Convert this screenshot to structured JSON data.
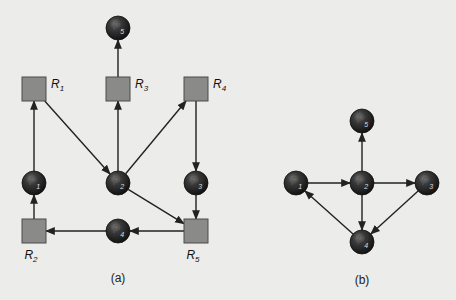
{
  "figure": {
    "panels": [
      {
        "id": "a",
        "caption": "(a)",
        "type": "resource-allocation-graph",
        "processes": [
          {
            "id": "P1",
            "name": "P",
            "sub": "1",
            "x": 34,
            "y": 183
          },
          {
            "id": "P2",
            "name": "P",
            "sub": "2",
            "x": 118,
            "y": 183
          },
          {
            "id": "P3",
            "name": "P",
            "sub": "3",
            "x": 196,
            "y": 183
          },
          {
            "id": "P4",
            "name": "P",
            "sub": "4",
            "x": 118,
            "y": 231
          },
          {
            "id": "P5",
            "name": "P",
            "sub": "5",
            "x": 118,
            "y": 28
          }
        ],
        "resources": [
          {
            "id": "R1",
            "name": "R",
            "sub": "1",
            "x": 34,
            "y": 89,
            "label_pos": "right"
          },
          {
            "id": "R2",
            "name": "R",
            "sub": "2",
            "x": 34,
            "y": 231,
            "label_pos": "below"
          },
          {
            "id": "R3",
            "name": "R",
            "sub": "3",
            "x": 118,
            "y": 89,
            "label_pos": "right"
          },
          {
            "id": "R4",
            "name": "R",
            "sub": "4",
            "x": 196,
            "y": 89,
            "label_pos": "right"
          },
          {
            "id": "R5",
            "name": "R",
            "sub": "5",
            "x": 196,
            "y": 231,
            "label_pos": "below"
          }
        ],
        "edges": [
          {
            "from": "P1",
            "to": "R1"
          },
          {
            "from": "R1",
            "to": "P2"
          },
          {
            "from": "P2",
            "to": "R3"
          },
          {
            "from": "R3",
            "to": "P5"
          },
          {
            "from": "P2",
            "to": "R4"
          },
          {
            "from": "R4",
            "to": "P3"
          },
          {
            "from": "P2",
            "to": "R5"
          },
          {
            "from": "P3",
            "to": "R5"
          },
          {
            "from": "R5",
            "to": "P4"
          },
          {
            "from": "P4",
            "to": "R2"
          },
          {
            "from": "R2",
            "to": "P1"
          }
        ]
      },
      {
        "id": "b",
        "caption": "(b)",
        "type": "wait-for-graph",
        "processes": [
          {
            "id": "P1",
            "name": "P",
            "sub": "1",
            "x": 296,
            "y": 183
          },
          {
            "id": "P2",
            "name": "P",
            "sub": "2",
            "x": 362,
            "y": 183
          },
          {
            "id": "P3",
            "name": "P",
            "sub": "3",
            "x": 427,
            "y": 183
          },
          {
            "id": "P4",
            "name": "P",
            "sub": "4",
            "x": 362,
            "y": 242
          },
          {
            "id": "P5",
            "name": "P",
            "sub": "5",
            "x": 362,
            "y": 121
          }
        ],
        "edges": [
          {
            "from": "P1",
            "to": "P2"
          },
          {
            "from": "P2",
            "to": "P3"
          },
          {
            "from": "P2",
            "to": "P5"
          },
          {
            "from": "P2",
            "to": "P4"
          },
          {
            "from": "P3",
            "to": "P4"
          },
          {
            "from": "P4",
            "to": "P1"
          }
        ]
      }
    ]
  },
  "colors": {
    "background": "#ececea",
    "resource_fill": "#8a8a88",
    "resource_stroke": "#4a4a48",
    "process_fill": "#2a2a2a",
    "edge": "#222222"
  }
}
